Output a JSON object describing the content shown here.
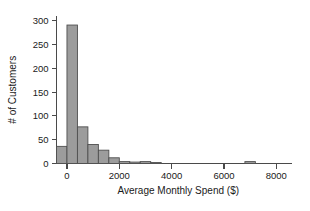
{
  "chart_data": {
    "type": "bar",
    "title": "",
    "subtitle": "",
    "xlabel": "Average Monthly Spend ($)",
    "ylabel": "# of Customers",
    "grid": false,
    "legend": false,
    "legend_position": "none",
    "bar_style": "histogram",
    "bar_fill_color": "#9c9c9c",
    "bar_edge_color": "#4f4f4f",
    "axis_color": "#4a4a4a",
    "background_color": "#ffffff",
    "xlim": [
      -400,
      8600
    ],
    "ylim": [
      0,
      310
    ],
    "bin_width": 400,
    "xticks": [
      0,
      2000,
      4000,
      6000,
      8000
    ],
    "xtick_labels": [
      "0",
      "2000",
      "4000",
      "6000",
      "8000"
    ],
    "yticks": [
      0,
      50,
      100,
      150,
      200,
      250,
      300
    ],
    "ytick_labels": [
      "0",
      "50",
      "100",
      "150",
      "200",
      "250",
      "300"
    ],
    "bins": [
      {
        "x0": -400,
        "x1": 0,
        "value": 36
      },
      {
        "x0": 0,
        "x1": 400,
        "value": 291
      },
      {
        "x0": 400,
        "x1": 800,
        "value": 77
      },
      {
        "x0": 800,
        "x1": 1200,
        "value": 40
      },
      {
        "x0": 1200,
        "x1": 1600,
        "value": 28
      },
      {
        "x0": 1600,
        "x1": 2000,
        "value": 12
      },
      {
        "x0": 2000,
        "x1": 2400,
        "value": 4
      },
      {
        "x0": 2400,
        "x1": 2800,
        "value": 3
      },
      {
        "x0": 2800,
        "x1": 3200,
        "value": 4
      },
      {
        "x0": 3200,
        "x1": 3600,
        "value": 2
      },
      {
        "x0": 6800,
        "x1": 7200,
        "value": 4
      }
    ],
    "categories": [
      "-400",
      "0",
      "400",
      "800",
      "1200",
      "1600",
      "2000",
      "2400",
      "2800",
      "3200",
      "6800"
    ],
    "values": [
      36,
      291,
      77,
      40,
      28,
      12,
      4,
      3,
      4,
      2,
      4
    ]
  }
}
